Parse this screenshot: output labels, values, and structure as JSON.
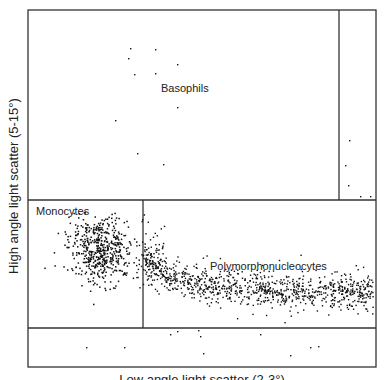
{
  "chart_data": {
    "type": "scatter",
    "title": "",
    "xlabel": "Low angle light scatter (2-3°)",
    "ylabel": "High angle light scatter (5-15°)",
    "grid": false,
    "legend": null,
    "regions": [
      {
        "name": "Basophils",
        "label": "Basophils",
        "x_range": [
          28,
          339
        ],
        "y_range": [
          10,
          200
        ],
        "density": "sparse",
        "approx_points": 12
      },
      {
        "name": "Monocytes",
        "label": "Monocytes",
        "x_range": [
          28,
          143
        ],
        "y_range": [
          200,
          328
        ],
        "density": "dense",
        "approx_points": 500
      },
      {
        "name": "Polymorphonucleocytes",
        "label": "Polymorphonucleocytes",
        "x_range": [
          143,
          376
        ],
        "y_range": [
          200,
          328
        ],
        "density": "dense",
        "approx_points": 900
      },
      {
        "name": "upper-right gate",
        "label": "",
        "x_range": [
          339,
          376
        ],
        "y_range": [
          10,
          200
        ],
        "density": "sparse",
        "approx_points": 5
      },
      {
        "name": "lower gate",
        "label": "",
        "x_range": [
          28,
          376
        ],
        "y_range": [
          328,
          367
        ],
        "density": "sparse",
        "approx_points": 10
      }
    ],
    "annotations": [
      "Basophils",
      "Monocytes",
      "Polymorphonucleocytes"
    ]
  },
  "labels": {
    "basophils": "Basophils",
    "monocytes": "Monocytes",
    "pmn": "Polymorphonucleocytes",
    "ylabel": "High angle light scatter (5-15°)",
    "xlabel": "Low angle light scatter (2-3°)"
  },
  "colors": {
    "line": "#333333",
    "dot": "#111111"
  }
}
